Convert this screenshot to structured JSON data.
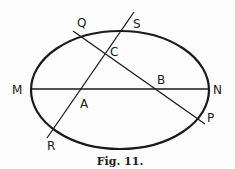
{
  "figure": {
    "caption": "Fig. 11.",
    "stroke_color": "#1a1a1a",
    "ellipse": {
      "cx": 120,
      "cy": 90,
      "rx": 89,
      "ry": 59
    },
    "lines": [
      {
        "name": "MN",
        "x1": 31,
        "y1": 89,
        "x2": 208,
        "y2": 89
      },
      {
        "name": "QP",
        "x1": 73,
        "y1": 31,
        "x2": 205,
        "y2": 124
      },
      {
        "name": "RS",
        "x1": 47,
        "y1": 138,
        "x2": 134,
        "y2": 12
      }
    ],
    "points": {
      "M": "M",
      "N": "N",
      "Q": "Q",
      "S": "S",
      "C": "C",
      "B": "B",
      "A": "A",
      "R": "R",
      "P": "P"
    }
  }
}
